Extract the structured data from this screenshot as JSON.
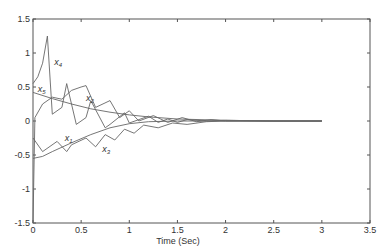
{
  "chart_data": {
    "type": "line",
    "title": "",
    "xlabel": "Time (Sec)",
    "ylabel": "",
    "xlim": [
      0,
      3.5
    ],
    "ylim": [
      -1.5,
      1.5
    ],
    "xticks": [
      "0",
      "0.5",
      "1",
      "1.5",
      "2",
      "2.5",
      "3",
      "3.5"
    ],
    "yticks": [
      "1.5",
      "1",
      "0.5",
      "0",
      "-0.5",
      "-1",
      "-1.5"
    ],
    "grid": false,
    "legend": "inline labels",
    "series": [
      {
        "name": "x4",
        "label": "x",
        "sub": "4",
        "label_pos": [
          0.22,
          0.82
        ],
        "x": [
          0,
          0.05,
          0.1,
          0.15,
          0.2,
          0.3,
          0.35,
          0.45,
          0.55,
          0.6,
          0.75,
          0.8,
          0.95,
          1.0,
          1.1,
          1.2,
          1.3,
          1.4,
          1.5,
          1.6,
          1.8,
          2.0,
          2.5,
          3.0
        ],
        "y": [
          0.55,
          0.65,
          0.85,
          1.25,
          0.1,
          0.2,
          0.55,
          -0.05,
          0.05,
          0.3,
          -0.1,
          -0.05,
          0.12,
          -0.03,
          0.02,
          0.07,
          -0.02,
          0.03,
          -0.02,
          0.02,
          0.0,
          0.01,
          0.0,
          0.0
        ]
      },
      {
        "name": "x5",
        "label": "x",
        "sub": "5",
        "label_pos": [
          0.05,
          0.42
        ],
        "x": [
          0,
          0.2,
          0.4,
          0.6,
          0.8,
          1.0,
          1.2,
          1.5,
          2.0,
          2.5,
          3.0
        ],
        "y": [
          0.42,
          0.33,
          0.25,
          0.18,
          0.13,
          0.09,
          0.06,
          0.03,
          0.01,
          0.0,
          0.0
        ]
      },
      {
        "name": "x2",
        "label": "x",
        "sub": "2",
        "label_pos": [
          0.55,
          0.3
        ],
        "x": [
          0,
          0.02,
          0.1,
          0.2,
          0.3,
          0.4,
          0.5,
          0.55,
          0.65,
          0.8,
          0.9,
          1.0,
          1.1,
          1.25,
          1.4,
          1.55,
          1.7,
          1.85,
          2.0,
          2.3,
          2.6,
          3.0
        ],
        "y": [
          -1.5,
          0.05,
          0.25,
          0.35,
          0.32,
          0.45,
          0.5,
          0.52,
          0.2,
          0.3,
          0.05,
          0.15,
          0.0,
          0.08,
          -0.02,
          0.05,
          -0.01,
          0.02,
          0.0,
          0.0,
          0.0,
          0.0
        ]
      },
      {
        "name": "x1",
        "label": "x",
        "sub": "1",
        "label_pos": [
          0.33,
          -0.3
        ],
        "x": [
          0,
          0.1,
          0.2,
          0.4,
          0.6,
          0.8,
          1.0,
          1.2,
          1.5,
          2.0,
          2.5,
          3.0
        ],
        "y": [
          -0.55,
          -0.52,
          -0.45,
          -0.32,
          -0.2,
          -0.1,
          -0.04,
          -0.01,
          0.0,
          0.0,
          0.0,
          0.0
        ]
      },
      {
        "name": "x3",
        "label": "x",
        "sub": "3",
        "label_pos": [
          0.72,
          -0.45
        ],
        "x": [
          0,
          0.1,
          0.25,
          0.35,
          0.4,
          0.55,
          0.65,
          0.75,
          0.85,
          0.95,
          1.05,
          1.15,
          1.3,
          1.45,
          1.6,
          1.8,
          2.0,
          2.5,
          3.0
        ],
        "y": [
          -0.25,
          -0.45,
          -0.3,
          -0.45,
          -0.35,
          -0.25,
          -0.38,
          -0.2,
          -0.28,
          -0.12,
          -0.18,
          -0.06,
          -0.1,
          -0.03,
          -0.05,
          -0.01,
          0.0,
          0.0,
          0.0
        ]
      }
    ]
  }
}
